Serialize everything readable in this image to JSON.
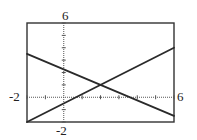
{
  "chart_data": {
    "type": "line",
    "title": "",
    "xlabel": "",
    "ylabel": "",
    "xlim": [
      -2,
      6
    ],
    "ylim": [
      -2,
      6
    ],
    "xscale": 1,
    "yscale": 1,
    "grid": false,
    "legend": null,
    "tick_labels": {
      "xmin": "-2",
      "xmax": "6",
      "ymin": "-2",
      "ymax": "6"
    },
    "series": [
      {
        "name": "decreasing line",
        "x": [
          -2,
          6
        ],
        "y": [
          3.5,
          -1.5
        ],
        "approx_equation": "y = -0.625x + 2.25"
      },
      {
        "name": "increasing line",
        "x": [
          -2,
          6
        ],
        "y": [
          -2,
          4
        ],
        "approx_equation": "y = 0.75x - 0.5"
      }
    ],
    "intersection": {
      "x": 2,
      "y": 1
    },
    "colors": {
      "lines": "#2a2a2a",
      "frame": "#333333",
      "axes": "#555555",
      "background": "#ffffff"
    }
  }
}
